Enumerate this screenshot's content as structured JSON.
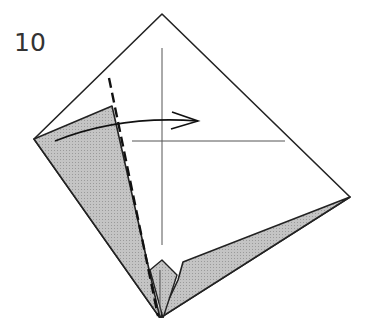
{
  "diagram": {
    "step_number": "10",
    "instruction": "Valley fold the left flap to the right along the dashed line",
    "colors": {
      "paper_white": "#ffffff",
      "paper_colored": "#b8b8b8",
      "line": "#222222",
      "crease": "#555555"
    },
    "elements": [
      {
        "name": "paper-outline",
        "shape": "kite",
        "vertices": [
          [
            162,
            14
          ],
          [
            350,
            197
          ],
          [
            160,
            318
          ],
          [
            34,
            139
          ]
        ]
      },
      {
        "name": "left-flap",
        "color": "gray"
      },
      {
        "name": "right-flap",
        "color": "gray"
      },
      {
        "name": "valley-fold-line",
        "style": "dashed"
      },
      {
        "name": "fold-arrow",
        "direction": "right"
      },
      {
        "name": "vertical-crease"
      },
      {
        "name": "horizontal-crease"
      }
    ]
  }
}
